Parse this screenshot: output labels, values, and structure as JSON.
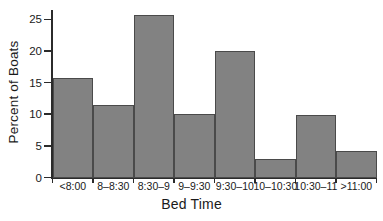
{
  "chart_data": {
    "type": "bar",
    "title": "",
    "subtitle": "",
    "xlabel": "Bed Time",
    "ylabel": "Percent of Boats",
    "categories": [
      "<8:00",
      "8–8:30",
      "8:30–9",
      "9–9:30",
      "9:30–10",
      "10–10:30",
      "10:30–11",
      ">11:00"
    ],
    "values": [
      15.7,
      11.4,
      25.7,
      10.0,
      20.0,
      2.9,
      9.9,
      4.2
    ],
    "ylim": [
      0,
      26.5
    ],
    "yticks": [
      0,
      5,
      10,
      15,
      20,
      25
    ],
    "ytick_labels": [
      "0",
      "5",
      "10",
      "15",
      "20",
      "25"
    ],
    "grid": false,
    "legend": null,
    "bar_color": "#828282",
    "bar_edge_color": "#4a4a4a",
    "axis_color": "#2b2b2b",
    "background": "#ffffff"
  }
}
